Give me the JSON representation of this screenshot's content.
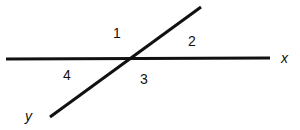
{
  "diagram": {
    "type": "intersecting-lines",
    "line_color": "#111111",
    "lines": [
      {
        "name": "x",
        "label": "x",
        "x1": 6,
        "y1": 59,
        "x2": 270,
        "y2": 58
      },
      {
        "name": "y",
        "label": "y",
        "x1": 50,
        "y1": 117,
        "x2": 201,
        "y2": 7
      }
    ],
    "angles": [
      {
        "label": "1",
        "x": 113,
        "y": 38
      },
      {
        "label": "2",
        "x": 188,
        "y": 46
      },
      {
        "label": "3",
        "x": 140,
        "y": 84
      },
      {
        "label": "4",
        "x": 63,
        "y": 80
      }
    ],
    "line_labels": [
      {
        "label": "x",
        "x": 281,
        "y": 63
      },
      {
        "label": "y",
        "x": 25,
        "y": 121
      }
    ]
  }
}
